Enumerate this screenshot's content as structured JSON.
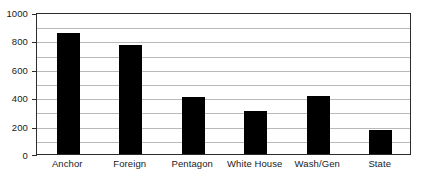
{
  "chart_data": {
    "type": "bar",
    "title": "",
    "subtitle": "",
    "xlabel": "",
    "ylabel": "",
    "categories": [
      "Anchor",
      "Foreign",
      "Pentagon",
      "White House",
      "Wash/Gen",
      "State"
    ],
    "values": [
      855,
      770,
      405,
      300,
      410,
      170
    ],
    "series": [
      {
        "name": "",
        "values": [
          855,
          770,
          405,
          300,
          410,
          170
        ]
      }
    ],
    "ylim": [
      0,
      1000
    ],
    "y_major_ticks": [
      0,
      200,
      400,
      600,
      800,
      1000
    ],
    "y_tick_labels": [
      "0",
      "200",
      "400",
      "600",
      "800",
      "1000"
    ],
    "y_minor_gridlines": [
      100,
      200,
      300,
      400,
      500,
      600,
      700,
      800,
      900
    ],
    "grid": "horizontal",
    "legend": "none",
    "bar_color": "#000000",
    "gridline_color": "#b9b9b9",
    "frame_color": "#2b2b2b",
    "background_color": "#ffffff",
    "annotations": []
  }
}
